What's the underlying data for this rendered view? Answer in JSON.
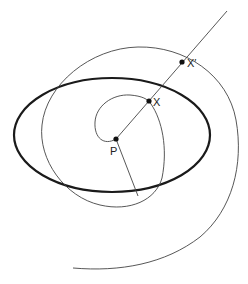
{
  "diagram": {
    "points": [
      {
        "id": "P",
        "label": "P",
        "x": 116,
        "y": 139
      },
      {
        "id": "X",
        "label": "X",
        "x": 149,
        "y": 101
      },
      {
        "id": "X_prime",
        "label": "X′",
        "x": 182,
        "y": 62
      }
    ],
    "colors": {
      "stroke": "#333333",
      "bold_stroke": "#1a1a1a",
      "point": "#111111",
      "background": "#ffffff"
    }
  }
}
